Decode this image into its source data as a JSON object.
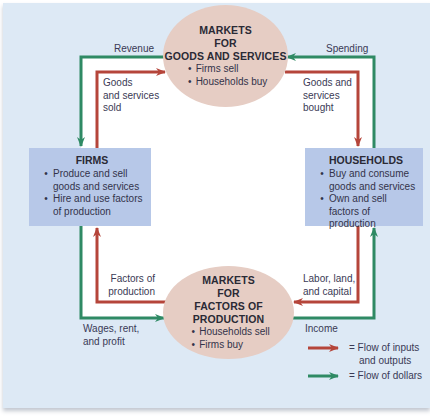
{
  "colors": {
    "panel_background": "#dde9f5",
    "interior_background": "#ffffff",
    "market_ellipse": "#e6cdc4",
    "sector_box": "#b7c8e8",
    "flow_inputs_outputs": "#b5453a",
    "flow_dollars": "#2f8a64"
  },
  "markets_goods": {
    "title_lines": [
      "MARKETS",
      "FOR",
      "GOODS AND SERVICES"
    ],
    "bullets": [
      "Firms sell",
      "Households buy"
    ]
  },
  "markets_factors": {
    "title_lines": [
      "MARKETS",
      "FOR",
      "FACTORS OF PRODUCTION"
    ],
    "bullets": [
      "Households sell",
      "Firms buy"
    ]
  },
  "firms": {
    "title": "FIRMS",
    "bullets": [
      "Produce and sell goods and services",
      "Hire and use factors of production"
    ]
  },
  "households": {
    "title": "HOUSEHOLDS",
    "bullets": [
      "Buy and consume goods and services",
      "Own and sell factors of production"
    ]
  },
  "flow_labels": {
    "revenue": "Revenue",
    "goods_sold": [
      "Goods",
      "and services",
      "sold"
    ],
    "spending": "Spending",
    "goods_bought": [
      "Goods and",
      "services",
      "bought"
    ],
    "factors_of_production": [
      "Factors of",
      "production"
    ],
    "wages_rent_profit": [
      "Wages, rent,",
      "and profit"
    ],
    "labor_land_capital": [
      "Labor, land,",
      "and capital"
    ],
    "income": "Income"
  },
  "legend": {
    "items": [
      {
        "arrow_color": "#b5453a",
        "lines": [
          "= Flow of inputs",
          "and outputs"
        ]
      },
      {
        "arrow_color": "#2f8a64",
        "lines": [
          "= Flow of dollars"
        ]
      }
    ]
  }
}
